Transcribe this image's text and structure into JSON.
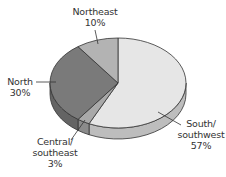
{
  "chart_data": {
    "type": "pie",
    "style": "3d",
    "title": "",
    "categories": [
      "South/southwest",
      "Central/southeast",
      "North",
      "Northeast"
    ],
    "values": [
      57,
      3,
      30,
      10
    ],
    "unit": "%",
    "colors": {
      "South/southwest": "#e6e6e6",
      "Central/southeast": "#a9a9a9",
      "North": "#7a7a7a",
      "Northeast": "#b3b3b3"
    },
    "legend": "none (callout labels)"
  },
  "labels": {
    "northeast": {
      "name": "Northeast",
      "value": "10%"
    },
    "north": {
      "name": "North",
      "value": "30%"
    },
    "central": {
      "name": "Central/",
      "name2": "southeast",
      "value": "3%"
    },
    "south": {
      "name": "South/",
      "name2": "southwest",
      "value": "57%"
    }
  }
}
